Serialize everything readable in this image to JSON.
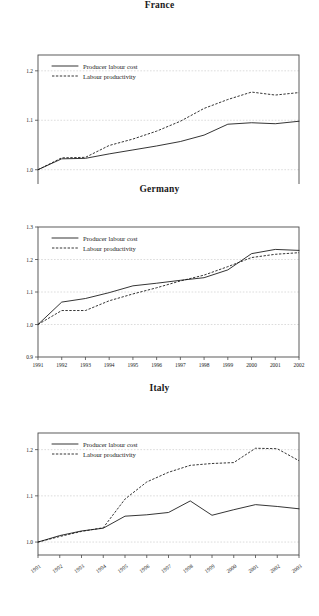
{
  "document": {
    "kind": "figure",
    "panel_count": 3
  },
  "legend": {
    "producer_label": "Producer labour cost",
    "productivity_label": "Labour productivity",
    "producer_style": "solid",
    "productivity_style": "dashed",
    "line_color": "#111111"
  },
  "axis_style": {
    "grid": true,
    "grid_color": "#b9b9b9",
    "frame_color": "#4a4a4a"
  },
  "chart_data": [
    {
      "type": "line",
      "title": "France",
      "xlabel": "",
      "ylabel": "",
      "x": [
        1991,
        1992,
        1993,
        1994,
        1995,
        1996,
        1997,
        1998,
        1999,
        2000,
        2001,
        2002
      ],
      "xtick_labels": [
        "1991",
        "1992",
        "1993",
        "1994",
        "1995",
        "1996",
        "1997",
        "1998",
        "1999",
        "2000",
        "2001",
        "2002"
      ],
      "ytick_labels": [
        "1.0",
        "1.1",
        "1.2"
      ],
      "yticks": [
        1.0,
        1.1,
        1.2
      ],
      "ylim": [
        0.963,
        1.232
      ],
      "legend_position": "top-left",
      "series": [
        {
          "name": "Producer labour cost",
          "style": "solid",
          "values": [
            1.0,
            1.022,
            1.023,
            1.032,
            1.04,
            1.048,
            1.057,
            1.07,
            1.092,
            1.095,
            1.093,
            1.098
          ]
        },
        {
          "name": "Labour productivity",
          "style": "dashed",
          "values": [
            1.0,
            1.024,
            1.025,
            1.049,
            1.062,
            1.078,
            1.098,
            1.124,
            1.142,
            1.157,
            1.151,
            1.156
          ]
        }
      ]
    },
    {
      "type": "line",
      "title": "Germany",
      "xlabel": "",
      "ylabel": "",
      "x": [
        1991,
        1992,
        1993,
        1994,
        1995,
        1996,
        1997,
        1998,
        1999,
        2000,
        2001,
        2002
      ],
      "xtick_labels": [
        "1991",
        "1992",
        "1993",
        "1994",
        "1995",
        "1996",
        "1997",
        "1998",
        "1999",
        "2000",
        "2001",
        "2002"
      ],
      "ytick_labels": [
        "0.9",
        "1.0",
        "1.1",
        "1.2",
        "1.3"
      ],
      "yticks": [
        0.9,
        1.0,
        1.1,
        1.2,
        1.3
      ],
      "ylim": [
        0.9,
        1.3
      ],
      "legend_position": "top-left",
      "series": [
        {
          "name": "Producer labour cost",
          "style": "solid",
          "values": [
            1.0,
            1.069,
            1.08,
            1.098,
            1.119,
            1.127,
            1.136,
            1.144,
            1.168,
            1.218,
            1.231,
            1.228
          ]
        },
        {
          "name": "Labour productivity",
          "style": "dashed",
          "values": [
            1.0,
            1.043,
            1.043,
            1.073,
            1.094,
            1.113,
            1.134,
            1.152,
            1.178,
            1.206,
            1.216,
            1.221
          ]
        }
      ]
    },
    {
      "type": "line",
      "title": "Italy",
      "xlabel": "",
      "ylabel": "",
      "x": [
        1991,
        1992,
        1993,
        1994,
        1995,
        1996,
        1997,
        1998,
        1999,
        2000,
        2001,
        2002,
        2003
      ],
      "xtick_labels": [
        "1991",
        "1992",
        "1993",
        "1994",
        "1995",
        "1996",
        "1997",
        "1998",
        "1999",
        "2000",
        "2001",
        "2002",
        "2003"
      ],
      "ytick_labels": [
        "1.0",
        "1.1",
        "1.2"
      ],
      "yticks": [
        1.0,
        1.1,
        1.2
      ],
      "ylim": [
        0.972,
        1.236
      ],
      "legend_position": "top-left",
      "series": [
        {
          "name": "Producer labour cost",
          "style": "solid",
          "values": [
            1.0,
            1.014,
            1.024,
            1.03,
            1.056,
            1.059,
            1.064,
            1.089,
            1.058,
            1.07,
            1.081,
            1.077,
            1.072
          ]
        },
        {
          "name": "Labour productivity",
          "style": "dashed",
          "values": [
            1.0,
            1.012,
            1.023,
            1.031,
            1.093,
            1.13,
            1.151,
            1.166,
            1.17,
            1.172,
            1.203,
            1.202,
            1.176
          ]
        }
      ]
    }
  ]
}
